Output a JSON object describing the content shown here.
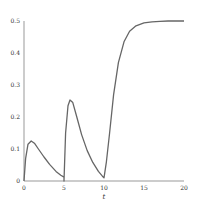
{
  "chart_data": {
    "type": "line",
    "title": "",
    "xlabel": "t",
    "ylabel": "",
    "xlim": [
      0,
      20
    ],
    "ylim": [
      0,
      0.5
    ],
    "xticks": [
      "0",
      "5",
      "10",
      "15",
      "20"
    ],
    "yticks": [
      "0",
      "0.1",
      "0.2",
      "0.3",
      "0.4",
      "0.5"
    ],
    "grid": false,
    "legend": null,
    "series": [
      {
        "name": "response",
        "color": "#666666",
        "x": [
          0,
          0.2,
          0.5,
          0.9,
          1.3,
          1.8,
          2.5,
          3.2,
          4.0,
          4.6,
          5.0,
          5.0,
          5.2,
          5.5,
          5.75,
          6.1,
          6.6,
          7.2,
          7.9,
          8.6,
          9.3,
          9.8,
          10.0,
          10.3,
          10.7,
          11.2,
          11.8,
          12.5,
          13.2,
          14.0,
          15.0,
          16.0,
          17.0,
          18.0,
          19.0,
          20.0
        ],
        "y": [
          0,
          0.07,
          0.115,
          0.125,
          0.118,
          0.1,
          0.075,
          0.052,
          0.03,
          0.018,
          0.012,
          0.0,
          0.15,
          0.235,
          0.253,
          0.245,
          0.2,
          0.145,
          0.095,
          0.058,
          0.03,
          0.015,
          0.01,
          0.06,
          0.15,
          0.27,
          0.37,
          0.435,
          0.468,
          0.485,
          0.494,
          0.497,
          0.499,
          0.5,
          0.5,
          0.5
        ]
      }
    ]
  }
}
